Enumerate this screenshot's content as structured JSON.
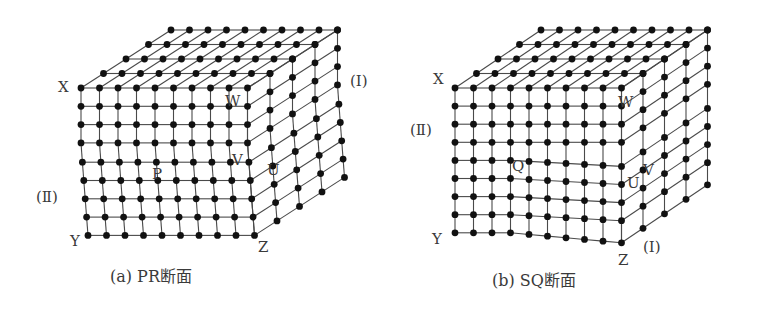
{
  "figures": [
    {
      "id": "a",
      "caption": "(a) PR断面",
      "labels": {
        "X": "X",
        "Y": "Y",
        "Z": "Z",
        "W": "W",
        "V": "V",
        "U": "U",
        "P": "P",
        "region_I": "(Ⅰ)",
        "region_II": "(Ⅱ)"
      },
      "lattice": {
        "front_columns": 10,
        "front_rows": 9,
        "depth_layers": 5,
        "defect": "edge step (slip offset at right side)"
      }
    },
    {
      "id": "b",
      "caption": "(b) SQ断面",
      "labels": {
        "X": "X",
        "Y": "Y",
        "Z": "Z",
        "W": "W",
        "V": "V",
        "U": "U",
        "Q": "Q",
        "region_I": "(Ⅰ)",
        "region_II": "(Ⅱ)"
      },
      "lattice": {
        "front_columns": 10,
        "front_rows": 9,
        "depth_layers": 5,
        "defect": "screw displacement (sheared lower-right block)"
      }
    }
  ],
  "style": {
    "line_color": "#4a4a4a",
    "dot_color": "#111111",
    "text_color": "#3a3a3a"
  }
}
